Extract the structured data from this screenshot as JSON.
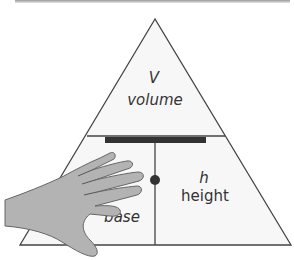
{
  "diagram": {
    "top": {
      "symbol": "V",
      "label": "volume"
    },
    "bottom_left": {
      "symbol": "b",
      "label": "base",
      "partially_hidden_text": "ase"
    },
    "bottom_right": {
      "symbol": "h",
      "label": "height"
    },
    "operator_top": "divide-bar",
    "operator_bottom": "multiply-dot",
    "covering": "hand-icon",
    "colors": {
      "triangle_fill": "#f7f7f7",
      "outline": "#444444",
      "bar": "#333333",
      "hand": "#b3b3b3",
      "hand_outline": "#666666"
    }
  }
}
